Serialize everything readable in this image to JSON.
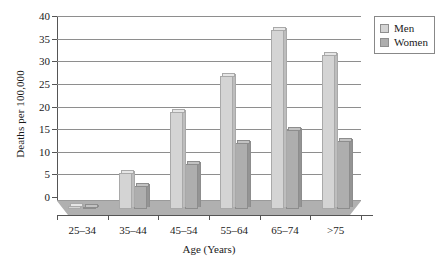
{
  "chart_data": {
    "type": "bar",
    "title": "",
    "xlabel": "Age (Years)",
    "ylabel": "Deaths per 100,000",
    "categories": [
      "25–34",
      "35–44",
      "45–54",
      "55–64",
      "65–74",
      ">75"
    ],
    "series": [
      {
        "name": "Men",
        "color": "#d4d4d4",
        "values": [
          0.6,
          8.0,
          21.5,
          29.5,
          39.5,
          34.0
        ]
      },
      {
        "name": "Women",
        "color": "#aeaeae",
        "values": [
          0.4,
          5.0,
          10.0,
          14.5,
          17.5,
          15.0
        ]
      }
    ],
    "ylim": [
      0,
      40
    ],
    "yticks": [
      0,
      5,
      10,
      15,
      20,
      25,
      30,
      35,
      40
    ],
    "ytick_labels": [
      "0",
      "5",
      "10",
      "15",
      "20",
      "25",
      "30",
      "35",
      "40"
    ],
    "grid": true,
    "legend_position": "top-right",
    "legend_entries": [
      "Men",
      "Women"
    ]
  }
}
